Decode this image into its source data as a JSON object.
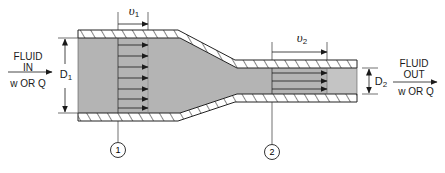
{
  "diagram": {
    "type": "pipe-reducer-flow",
    "colors": {
      "fluid": "#b4b4b4",
      "wall": "#ffffff",
      "line": "#222222",
      "background": "#ffffff"
    },
    "inlet": {
      "line1": "FLUID",
      "line2": "IN",
      "line3": "w OR Q"
    },
    "outlet": {
      "line1": "FLUID",
      "line2": "OUT",
      "line3": "w OR Q"
    },
    "section1": {
      "velocity_symbol": "υ",
      "velocity_subscript": "1",
      "diameter_symbol": "D",
      "diameter_subscript": "1",
      "marker": "1"
    },
    "section2": {
      "velocity_symbol": "υ",
      "velocity_subscript": "2",
      "diameter_symbol": "D",
      "diameter_subscript": "2",
      "marker": "2"
    }
  }
}
